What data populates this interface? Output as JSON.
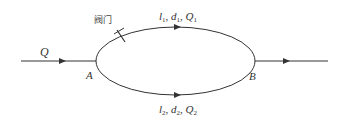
{
  "diagram": {
    "inflow_label": "Q",
    "node_a": "A",
    "node_b": "B",
    "valve_label": "阀门",
    "upper_branch": {
      "l": "l",
      "l_sub": "1",
      "d": "d",
      "d_sub": "1",
      "q": "Q",
      "q_sub": "1"
    },
    "lower_branch": {
      "l": "l",
      "l_sub": "2",
      "d": "d",
      "d_sub": "2",
      "q": "Q",
      "q_sub": "2"
    },
    "colors": {
      "line": "#333333",
      "background": "#ffffff"
    }
  }
}
